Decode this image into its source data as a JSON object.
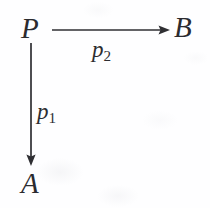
{
  "diagram": {
    "kind": "commutative-diagram",
    "title": "",
    "canvas": {
      "width": 210,
      "height": 208,
      "background": "#fefeff"
    },
    "ink_color": "#2b2b2f",
    "nodes": [
      {
        "id": "P",
        "label": "P",
        "x": 21,
        "y": 14,
        "role": "source-object"
      },
      {
        "id": "B",
        "label": "B",
        "x": 174,
        "y": 13,
        "role": "target-object"
      },
      {
        "id": "A",
        "label": "A",
        "x": 21,
        "y": 169,
        "role": "target-object"
      }
    ],
    "edges": [
      {
        "id": "p2",
        "from": "P",
        "to": "B",
        "label_main": "p",
        "label_sub": "2",
        "direction": "right",
        "x1": 52,
        "y1": 30,
        "x2": 170,
        "y2": 30,
        "label_x": 92,
        "label_y": 38
      },
      {
        "id": "p1",
        "from": "P",
        "to": "A",
        "label_main": "p",
        "label_sub": "1",
        "direction": "down",
        "x1": 31,
        "y1": 43,
        "x2": 31,
        "y2": 166,
        "label_x": 37,
        "label_y": 100
      }
    ]
  }
}
